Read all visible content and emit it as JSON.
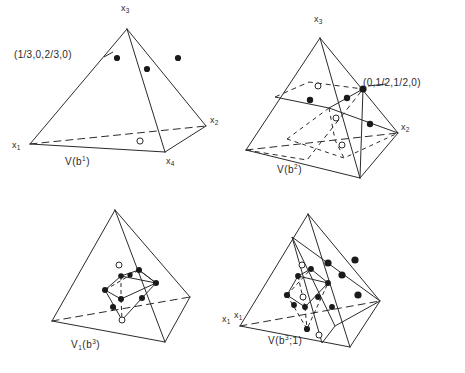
{
  "figure": {
    "stroke_color": "#2b2b2b",
    "fill_dot_color": "#1a1a1a",
    "open_dot_color": "#ffffff"
  },
  "panels": [
    {
      "id": "panel-1",
      "caption": "V(b",
      "caption_sup": "1",
      "caption_tail": ")",
      "caption_full": "V(b1)",
      "annotation": "(1/3,0,2/3,0)",
      "vertices": [
        {
          "name": "x",
          "sub": "3",
          "x": 107,
          "y": 12
        },
        {
          "name": "x",
          "sub": "1",
          "x": 18,
          "y": 137
        },
        {
          "name": "x",
          "sub": "2",
          "x": 182,
          "y": 113
        },
        {
          "name": "x",
          "sub": "4",
          "x": 160,
          "y": 159
        }
      ],
      "filled_points": 3,
      "open_points": 1
    },
    {
      "id": "panel-2",
      "caption": "V(b",
      "caption_sup": "2",
      "caption_tail": ")",
      "caption_full": "V(b2)",
      "annotation": "(0,1/2,1/2,0)",
      "vertices": [
        {
          "name": "x",
          "sub": "3",
          "x": 315,
          "y": 14
        },
        {
          "name": "x",
          "sub": "2",
          "x": 400,
          "y": 121
        }
      ],
      "filled_points": 5,
      "open_points": 3
    },
    {
      "id": "panel-3",
      "caption": "V",
      "caption_sub": "1",
      "caption_mid": "(b",
      "caption_sup": "3",
      "caption_tail": ")",
      "caption_full": "V1(b3)",
      "annotation": "",
      "vertices": [],
      "filled_points": 10,
      "open_points": 2
    },
    {
      "id": "panel-4",
      "caption": "V(b",
      "caption_sup": "3",
      "caption_mid2": ";1",
      "caption_tail": ")",
      "caption_full": "V(b3;1)",
      "annotation": "",
      "vertices": [
        {
          "name": "x",
          "sub": "1",
          "x": 238,
          "y": 310
        }
      ],
      "filled_points": 13,
      "open_points": 3
    }
  ],
  "labels": {
    "x1": "x",
    "x2": "x",
    "x3": "x",
    "x4": "x",
    "sub1": "1",
    "sub2": "2",
    "sub3": "3",
    "sub4": "4",
    "coord_a": "(1/3,0,2/3,0)",
    "coord_b": "(0,1/2,1/2,0)",
    "cap1_main": "V(b",
    "cap1_sup": "1",
    "cap1_end": ")",
    "cap2_main": "V(b",
    "cap2_sup": "2",
    "cap2_end": ")",
    "cap3_main": "V",
    "cap3_sub": "1",
    "cap3_mid": "(b",
    "cap3_sup": "3",
    "cap3_end": ")",
    "cap4_main": "V(b",
    "cap4_sup": "3",
    "cap4_mid": ";1",
    "cap4_end": ")"
  }
}
